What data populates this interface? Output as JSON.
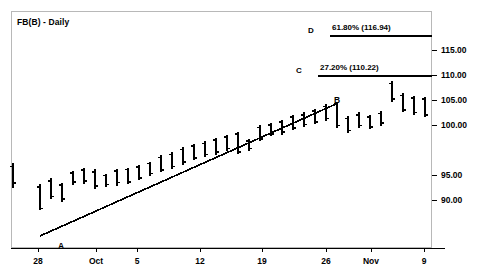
{
  "chart_title": "FB(B) - Daily",
  "axes": {
    "y_ticks": [
      {
        "label": "115.00",
        "value": 115.0,
        "y": 50
      },
      {
        "label": "110.00",
        "value": 110.0,
        "y": 75
      },
      {
        "label": "105.00",
        "value": 105.0,
        "y": 100
      },
      {
        "label": "100.00",
        "value": 100.0,
        "y": 125
      },
      {
        "label": "95.00",
        "value": 95.0,
        "y": 175
      },
      {
        "label": "90.00",
        "value": 90.0,
        "y": 200
      }
    ],
    "x_ticks": [
      {
        "label": "28",
        "x": 38
      },
      {
        "label": "Oct",
        "x": 96
      },
      {
        "label": "5",
        "x": 137
      },
      {
        "label": "12",
        "x": 200
      },
      {
        "label": "19",
        "x": 262
      },
      {
        "label": "26",
        "x": 326
      },
      {
        "label": "Nov",
        "x": 371
      },
      {
        "label": "9",
        "x": 424
      }
    ]
  },
  "levels": [
    {
      "key": "D",
      "label": "61.80% (116.94)",
      "percent": 61.8,
      "price": 116.94,
      "y": 36
    },
    {
      "key": "C",
      "label": "27.20% (110.22)",
      "percent": 27.2,
      "price": 110.22,
      "y": 76
    }
  ],
  "trendline": {
    "start_label": "A",
    "end_label": "B",
    "start": {
      "x": 40,
      "y": 236
    },
    "end": {
      "x": 336,
      "y": 104
    }
  },
  "colors": {
    "line": "#000000",
    "frame": "#b8b8b8",
    "background": "#ffffff"
  },
  "chart_data": {
    "type": "bar",
    "title": "FB(B) - Daily",
    "xlabel": "",
    "ylabel": "",
    "ylim": [
      86.5,
      119.5
    ],
    "grid": false,
    "legend": null,
    "categories": [
      "28",
      "Oct",
      "5",
      "12",
      "19",
      "26",
      "Nov",
      "9"
    ],
    "series": [
      {
        "name": "FB(B) Daily OHLC",
        "bars": [
          {
            "x": 13,
            "high": 96.2,
            "low": 92.0,
            "open": 95.6,
            "close": 92.8
          },
          {
            "x": 40,
            "high": 92.6,
            "low": 88.3,
            "open": 92.2,
            "close": 88.6
          },
          {
            "x": 51,
            "high": 93.6,
            "low": 90.1,
            "open": 93.2,
            "close": 90.6
          },
          {
            "x": 62,
            "high": 92.9,
            "low": 89.6,
            "open": 92.5,
            "close": 90.2
          },
          {
            "x": 73,
            "high": 94.9,
            "low": 92.5,
            "open": 94.5,
            "close": 93.0
          },
          {
            "x": 84,
            "high": 95.3,
            "low": 92.7,
            "open": 95.0,
            "close": 93.2
          },
          {
            "x": 95,
            "high": 95.1,
            "low": 91.8,
            "open": 94.7,
            "close": 92.3
          },
          {
            "x": 106,
            "high": 94.4,
            "low": 92.2,
            "open": 94.1,
            "close": 92.6
          },
          {
            "x": 117,
            "high": 95.2,
            "low": 92.4,
            "open": 94.8,
            "close": 92.9
          },
          {
            "x": 128,
            "high": 95.4,
            "low": 92.6,
            "open": 95.1,
            "close": 93.0
          },
          {
            "x": 139,
            "high": 95.9,
            "low": 93.3,
            "open": 95.5,
            "close": 93.7
          },
          {
            "x": 150,
            "high": 96.4,
            "low": 94.0,
            "open": 96.1,
            "close": 94.4
          },
          {
            "x": 161,
            "high": 97.5,
            "low": 94.6,
            "open": 97.1,
            "close": 95.0
          },
          {
            "x": 172,
            "high": 98.0,
            "low": 95.2,
            "open": 97.6,
            "close": 95.6
          },
          {
            "x": 183,
            "high": 98.8,
            "low": 95.9,
            "open": 98.4,
            "close": 96.3
          },
          {
            "x": 194,
            "high": 99.4,
            "low": 96.6,
            "open": 99.0,
            "close": 97.0
          },
          {
            "x": 205,
            "high": 99.8,
            "low": 97.1,
            "open": 99.4,
            "close": 97.6
          },
          {
            "x": 216,
            "high": 100.4,
            "low": 97.5,
            "open": 100.0,
            "close": 98.0
          },
          {
            "x": 227,
            "high": 100.9,
            "low": 98.2,
            "open": 100.5,
            "close": 98.6
          },
          {
            "x": 238,
            "high": 101.4,
            "low": 97.6,
            "open": 101.0,
            "close": 98.0
          },
          {
            "x": 249,
            "high": 100.2,
            "low": 98.2,
            "open": 99.8,
            "close": 98.6
          },
          {
            "x": 260,
            "high": 102.5,
            "low": 99.8,
            "open": 102.1,
            "close": 100.2
          },
          {
            "x": 271,
            "high": 102.9,
            "low": 100.6,
            "open": 102.5,
            "close": 101.0
          },
          {
            "x": 282,
            "high": 103.4,
            "low": 100.9,
            "open": 103.0,
            "close": 101.3
          },
          {
            "x": 293,
            "high": 104.2,
            "low": 101.6,
            "open": 103.8,
            "close": 102.0
          },
          {
            "x": 304,
            "high": 104.6,
            "low": 102.2,
            "open": 104.2,
            "close": 102.6
          },
          {
            "x": 315,
            "high": 105.2,
            "low": 102.6,
            "open": 104.8,
            "close": 103.0
          },
          {
            "x": 326,
            "high": 106.0,
            "low": 103.2,
            "open": 105.6,
            "close": 103.6
          },
          {
            "x": 337,
            "high": 106.4,
            "low": 102.0,
            "open": 106.0,
            "close": 102.4
          },
          {
            "x": 348,
            "high": 104.0,
            "low": 101.2,
            "open": 103.6,
            "close": 101.6
          },
          {
            "x": 359,
            "high": 104.6,
            "low": 102.0,
            "open": 104.2,
            "close": 102.4
          },
          {
            "x": 370,
            "high": 104.2,
            "low": 101.8,
            "open": 103.8,
            "close": 102.2
          },
          {
            "x": 381,
            "high": 104.8,
            "low": 102.4,
            "open": 104.4,
            "close": 102.8
          },
          {
            "x": 392,
            "high": 109.8,
            "low": 106.4,
            "open": 109.4,
            "close": 106.8
          },
          {
            "x": 403,
            "high": 107.8,
            "low": 104.6,
            "open": 107.4,
            "close": 105.0
          },
          {
            "x": 414,
            "high": 107.4,
            "low": 104.2,
            "open": 107.0,
            "close": 104.6
          },
          {
            "x": 425,
            "high": 107.2,
            "low": 103.8,
            "open": 106.8,
            "close": 104.2
          }
        ]
      }
    ],
    "annotations": [
      {
        "text": "A",
        "x": 58,
        "y": 241,
        "meaning": "trendline start pivot low"
      },
      {
        "text": "B",
        "x": 334,
        "y": 95,
        "meaning": "trendline end pivot high"
      },
      {
        "text": "C",
        "x": 308,
        "y": 73,
        "meaning": "27.20% (110.22) level marker"
      },
      {
        "text": "D",
        "x": 308,
        "y": 33,
        "meaning": "61.80% (116.94) level marker"
      }
    ],
    "level_lines": [
      {
        "key": "D",
        "price": 116.94,
        "percent": 61.8,
        "x_start": 330,
        "x_end": 432
      },
      {
        "key": "C",
        "price": 110.22,
        "percent": 27.2,
        "x_start": 318,
        "x_end": 432
      }
    ]
  }
}
